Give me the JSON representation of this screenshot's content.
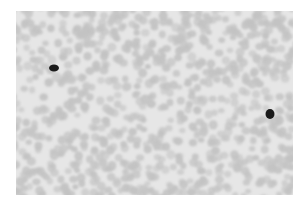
{
  "image": {
    "subject": "blood smear micrograph",
    "mode": "grayscale",
    "background_color": "#ffffff",
    "field_color": "#e4e4e4",
    "cell_color": "#c4c4c4",
    "nucleus_color": "#1a1a1a",
    "dark_cells": [
      {
        "label": "leukocyte-left",
        "cx": 38,
        "cy": 57,
        "rx": 5,
        "ry": 3.5
      },
      {
        "label": "leukocyte-right",
        "cx": 254,
        "cy": 103,
        "rx": 4.5,
        "ry": 5
      }
    ]
  }
}
